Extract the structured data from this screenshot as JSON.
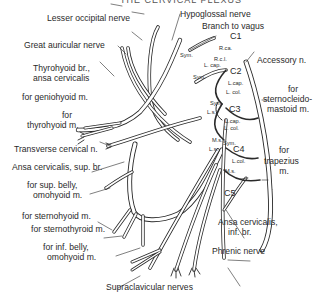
{
  "title": "THE CERVICAL PLEXUS",
  "labels": {
    "lesser_occipital": "Lesser occipital nerve",
    "great_auricular": "Great auricular nerve",
    "thyrohyoid_br_1": "Thyrohyoid br.,",
    "thyrohyoid_br_2": "ansa cervicalis",
    "geniohyoid": "for geniohyoid m.",
    "thyrohyoid_m_1": "for",
    "thyrohyoid_m_2": "thyrohyoid m.",
    "transverse_cervical": "Transverse cervical n.",
    "ansa_sup": "Ansa cervicalis, sup. br.",
    "sup_belly_1": "for sup. belly,",
    "sup_belly_2": "omohyoid m.",
    "sternohyoid": "for sternohyoid m.",
    "sternothyroid": "for sternothyroid m.",
    "inf_belly_1": "for inf. belly,",
    "inf_belly_2": "omohyoid m.",
    "supraclavicular": "Supraclavicular nerves",
    "hypoglossal": "Hypoglossal nerve",
    "branch_vagus": "Branch to vagus",
    "accessory": "Accessory n.",
    "scm_1": "for",
    "scm_2": "sternocleido-",
    "scm_3": "mastoid m.",
    "trapezius_1": "for",
    "trapezius_2": "trapezius",
    "trapezius_3": "m.",
    "ansa_inf_1": "Ansa cervicalis,",
    "ansa_inf_2": "inf. br.",
    "phrenic": "Phrenic nerve"
  },
  "roots": {
    "c1": "C1",
    "c2": "C2",
    "c3": "C3",
    "c4": "C4",
    "c5": "C5"
  },
  "small_labels": {
    "r_ca": "R.ca.",
    "r_cl": "R.c.l.",
    "l_cap_1": "L. cap.",
    "sym_1": "Sym.",
    "sym_2": "Sym.",
    "l_cap_2": "L.cap.",
    "l_col_2": "L. col.",
    "sym_3": "Sym.",
    "ls_3": "L.s.",
    "l_cap_3": "L.cap.",
    "l_col_3": "L. col.",
    "ms_4a": "M.s.",
    "sym_4": "Sym.",
    "ls_4": "L.s.",
    "l_col_4": "L.col.",
    "ms_4b": "M.s."
  },
  "colors": {
    "ink": "#2a2a2a",
    "nerve_fill": "#ffffff",
    "nerve_shade": "#9a9a9a"
  }
}
